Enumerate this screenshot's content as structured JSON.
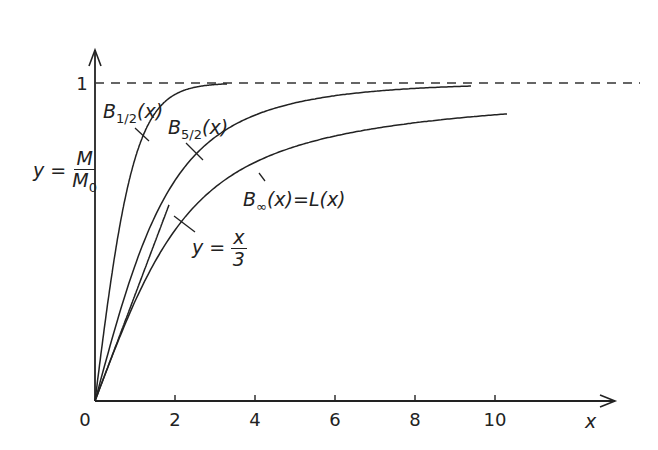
{
  "chart_data": {
    "type": "line",
    "title": "",
    "xlabel": "x",
    "ylabel": "y = M / M0",
    "xlim": [
      0,
      10.5
    ],
    "ylim": [
      0,
      1.1
    ],
    "x_ticks": [
      "0",
      "2",
      "4",
      "6",
      "8",
      "10"
    ],
    "y_ticks": [
      "1"
    ],
    "grid": false,
    "reference_lines": [
      {
        "name": "saturation",
        "y": 1,
        "style": "dashed"
      }
    ],
    "series": [
      {
        "name": "B_{1/2}(x)",
        "function": "tanh(x)",
        "x_range": [
          0,
          3.3
        ],
        "x": [
          0,
          0.5,
          1,
          1.5,
          2,
          2.5,
          3,
          3.3
        ],
        "values": [
          0,
          0.46,
          0.76,
          0.91,
          0.96,
          0.99,
          1.0,
          1.0
        ]
      },
      {
        "name": "B_{5/2}(x)",
        "function": "Brillouin J=5/2",
        "x_range": [
          0,
          9.4
        ],
        "x": [
          0,
          1,
          2,
          3,
          4,
          5,
          6,
          7,
          8,
          9,
          9.4
        ],
        "values": [
          0,
          0.39,
          0.67,
          0.82,
          0.89,
          0.93,
          0.95,
          0.96,
          0.97,
          0.97,
          0.97
        ]
      },
      {
        "name": "B_∞(x)=L(x)",
        "function": "coth(x) - 1/x",
        "x_range": [
          0,
          10.3
        ],
        "x": [
          0,
          1,
          2,
          3,
          4,
          5,
          6,
          7,
          8,
          9,
          10,
          10.3
        ],
        "values": [
          0,
          0.31,
          0.54,
          0.67,
          0.75,
          0.8,
          0.83,
          0.86,
          0.88,
          0.89,
          0.9,
          0.9
        ]
      },
      {
        "name": "y = x/3",
        "function": "x/3",
        "x_range": [
          0,
          1.85
        ],
        "x": [
          0,
          1.85
        ],
        "values": [
          0,
          0.62
        ]
      }
    ],
    "annotations": [
      "B_{1/2}(x)",
      "B_{5/2}(x)",
      "B_∞(x)=L(x)",
      "y = x/3"
    ]
  },
  "labels": {
    "y_axis": {
      "lhs": "y =",
      "num": "M",
      "den_base": "M",
      "den_sub": "0"
    },
    "x_axis": "x",
    "one": "1",
    "b_half": {
      "base": "B",
      "sub": "1/2",
      "arg": "(x)"
    },
    "b_five_half": {
      "base": "B",
      "sub": "5/2",
      "arg": "(x)"
    },
    "b_inf": {
      "base": "B",
      "sub": "∞",
      "arg": "(x)=L(x)"
    },
    "linear": {
      "lhs": "y =",
      "num": "x",
      "den": "3"
    }
  },
  "colors": {
    "ink": "#222222",
    "background": "#ffffff"
  }
}
